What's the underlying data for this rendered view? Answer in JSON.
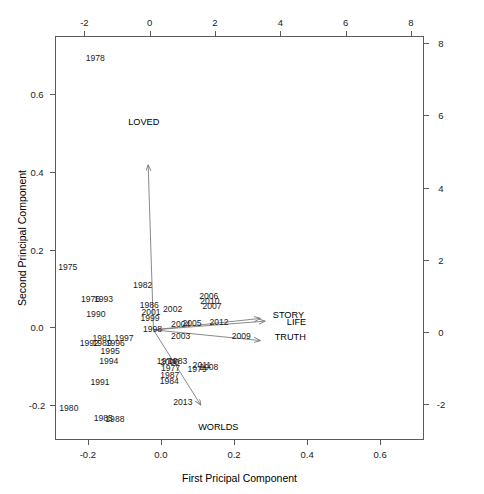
{
  "chart_data": {
    "type": "scatter",
    "title": "",
    "xlabel": "First Pricipal Component",
    "ylabel": "Second Principal Component",
    "xlim": [
      -0.29,
      0.72
    ],
    "ylim": [
      -0.29,
      0.75
    ],
    "xticks": [
      "-0.2",
      "0.0",
      "0.2",
      "0.4",
      "0.6"
    ],
    "xtickvals": [
      -0.2,
      0.0,
      0.2,
      0.4,
      0.6
    ],
    "yticks": [
      "-0.2",
      "0.0",
      "0.2",
      "0.4",
      "0.6"
    ],
    "ytickvals": [
      -0.2,
      0.0,
      0.2,
      0.4,
      0.6
    ],
    "top_axis_label": "",
    "top_ticks": [
      "-2",
      "0",
      "2",
      "4",
      "6",
      "8"
    ],
    "top_tickvals": [
      -2,
      0,
      2,
      4,
      6,
      8
    ],
    "top_xlim": [
      -2.9,
      8.4
    ],
    "right_ticks": [
      "-2",
      "0",
      "2",
      "4",
      "6",
      "8"
    ],
    "right_tickvals": [
      -2,
      0,
      2,
      4,
      6,
      8
    ],
    "right_ylim": [
      -3.0,
      8.2
    ],
    "grid": false,
    "legend": "none",
    "points": [
      {
        "label": "1974",
        "x": 0.015,
        "y": -0.087
      },
      {
        "label": "1975",
        "x": -0.255,
        "y": 0.156
      },
      {
        "label": "1976",
        "x": -0.193,
        "y": 0.072
      },
      {
        "label": "1977",
        "x": 0.026,
        "y": -0.104
      },
      {
        "label": "1978",
        "x": -0.18,
        "y": 0.694
      },
      {
        "label": "1979",
        "x": 0.099,
        "y": -0.106
      },
      {
        "label": "1980",
        "x": -0.252,
        "y": -0.207
      },
      {
        "label": "1981",
        "x": -0.161,
        "y": -0.027
      },
      {
        "label": "1982",
        "x": -0.05,
        "y": 0.108
      },
      {
        "label": "1983",
        "x": 0.046,
        "y": -0.087
      },
      {
        "label": "1984",
        "x": 0.023,
        "y": -0.137
      },
      {
        "label": "1985",
        "x": -0.158,
        "y": -0.233
      },
      {
        "label": "1986",
        "x": -0.032,
        "y": 0.057
      },
      {
        "label": "1987",
        "x": 0.024,
        "y": -0.122
      },
      {
        "label": "1988",
        "x": -0.126,
        "y": -0.236
      },
      {
        "label": "1989",
        "x": -0.161,
        "y": -0.041
      },
      {
        "label": "1990",
        "x": -0.178,
        "y": 0.035
      },
      {
        "label": "1991",
        "x": -0.167,
        "y": -0.14
      },
      {
        "label": "1992",
        "x": -0.196,
        "y": -0.041
      },
      {
        "label": "1993",
        "x": -0.157,
        "y": 0.072
      },
      {
        "label": "1994",
        "x": -0.143,
        "y": -0.087
      },
      {
        "label": "1995",
        "x": -0.139,
        "y": -0.062
      },
      {
        "label": "1996",
        "x": -0.125,
        "y": -0.041
      },
      {
        "label": "1997",
        "x": -0.101,
        "y": -0.027
      },
      {
        "label": "1998",
        "x": -0.023,
        "y": -0.004
      },
      {
        "label": "1999",
        "x": -0.03,
        "y": 0.025
      },
      {
        "label": "2000",
        "x": 0.024,
        "y": -0.09
      },
      {
        "label": "2001",
        "x": -0.027,
        "y": 0.04
      },
      {
        "label": "2002",
        "x": 0.032,
        "y": 0.048
      },
      {
        "label": "2003",
        "x": 0.054,
        "y": -0.021
      },
      {
        "label": "2004",
        "x": 0.054,
        "y": 0.009
      },
      {
        "label": "2005",
        "x": 0.085,
        "y": 0.011
      },
      {
        "label": "2006",
        "x": 0.131,
        "y": 0.081
      },
      {
        "label": "2007",
        "x": 0.14,
        "y": 0.054
      },
      {
        "label": "2008",
        "x": 0.131,
        "y": -0.101
      },
      {
        "label": "2009",
        "x": 0.22,
        "y": -0.021
      },
      {
        "label": "2010",
        "x": 0.134,
        "y": 0.068
      },
      {
        "label": "2011",
        "x": 0.112,
        "y": -0.096
      },
      {
        "label": "2012",
        "x": 0.159,
        "y": 0.013
      },
      {
        "label": "2013",
        "x": 0.06,
        "y": -0.191
      }
    ],
    "vectors": [
      {
        "label": "LOVED",
        "tip_x": -0.035,
        "tip_y": 0.418,
        "label_x": -0.047,
        "label_y": 0.528
      },
      {
        "label": "STORY",
        "tip_x": 0.272,
        "tip_y": 0.023,
        "label_x": 0.349,
        "label_y": 0.031
      },
      {
        "label": "LIFE",
        "tip_x": 0.285,
        "tip_y": 0.016,
        "label_x": 0.371,
        "label_y": 0.013
      },
      {
        "label": "TRUTH",
        "tip_x": 0.272,
        "tip_y": -0.034,
        "label_x": 0.354,
        "label_y": -0.024
      },
      {
        "label": "WORLDS",
        "tip_x": 0.109,
        "tip_y": -0.2,
        "label_x": 0.157,
        "label_y": -0.256
      }
    ],
    "vector_origin": {
      "x": -0.0205,
      "y": -0.0065
    },
    "arrow_color": "#7d7d7d",
    "axis_color": "#5a5a5a",
    "text_color": "#1a1a1a"
  }
}
